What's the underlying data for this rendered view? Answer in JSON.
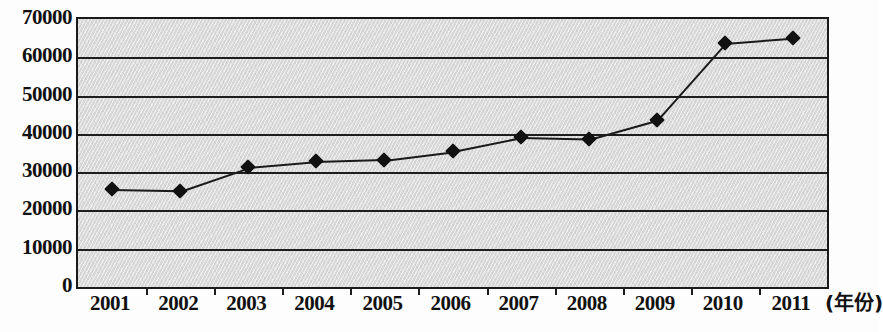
{
  "chart_data": {
    "type": "line",
    "title": "",
    "xlabel": "(年份)",
    "ylabel": "",
    "categories": [
      "2001",
      "2002",
      "2003",
      "2004",
      "2005",
      "2006",
      "2007",
      "2008",
      "2009",
      "2010",
      "2011"
    ],
    "values": [
      25500,
      25200,
      31300,
      32800,
      33300,
      35500,
      39100,
      38700,
      43700,
      63700,
      65100
    ],
    "series": [
      {
        "name": "series-1",
        "values": [
          25500,
          25200,
          31300,
          32800,
          33300,
          35500,
          39100,
          38700,
          43700,
          63700,
          65100
        ]
      }
    ],
    "ylim": [
      0,
      70000
    ],
    "ytick_labels": [
      "70000",
      "60000",
      "50000",
      "40000",
      "30000",
      "20000",
      "10000",
      "0"
    ],
    "ytick_values": [
      70000,
      60000,
      50000,
      40000,
      30000,
      20000,
      10000,
      0
    ],
    "ytick_step": 10000,
    "grid": true,
    "grid_axis": "y",
    "legend": "none",
    "marker": "diamond",
    "colors": {
      "line": "#1a1a1a",
      "marker": "#111111",
      "grid": "#1d1d1d",
      "axis": "#1a1a1a",
      "plot_background": "#d9d9d9",
      "figure_background": "#fdfdfd",
      "text": "#111111"
    }
  }
}
